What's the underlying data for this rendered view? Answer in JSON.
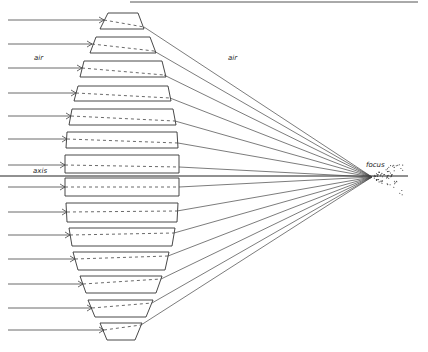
{
  "diagram": {
    "labels": {
      "air_left": "air",
      "air_right": "air",
      "axis": "axis",
      "focus": "focus"
    },
    "colors": {
      "stroke": "#333333",
      "ray": "#444444",
      "background": "#ffffff"
    },
    "focus_point": [
      372,
      177
    ],
    "axis_y": 176,
    "top_rule": [
      130,
      418,
      2
    ],
    "prisms": [
      {
        "top": [
          108,
          138,
          13
        ],
        "bot": [
          100,
          144,
          29
        ],
        "in": [
          104,
          20
        ],
        "out": [
          144,
          27
        ]
      },
      {
        "top": [
          96,
          150,
          37
        ],
        "bot": [
          90,
          156,
          53
        ],
        "in": [
          92,
          44
        ],
        "out": [
          154,
          51
        ]
      },
      {
        "top": [
          84,
          162,
          61
        ],
        "bot": [
          80,
          166,
          77
        ],
        "in": [
          82,
          68
        ],
        "out": [
          164,
          75
        ]
      },
      {
        "top": [
          78,
          168,
          86
        ],
        "bot": [
          74,
          171,
          101
        ],
        "in": [
          76,
          93
        ],
        "out": [
          170,
          98
        ]
      },
      {
        "top": [
          72,
          173,
          109
        ],
        "bot": [
          69,
          176,
          125
        ],
        "in": [
          71,
          116
        ],
        "out": [
          175,
          121
        ]
      },
      {
        "top": [
          67,
          177,
          132
        ],
        "bot": [
          66,
          178,
          148
        ],
        "in": [
          67,
          139
        ],
        "out": [
          178,
          143
        ]
      },
      {
        "top": [
          65,
          179,
          155
        ],
        "bot": [
          65,
          179,
          173
        ],
        "in": [
          65,
          165
        ],
        "out": [
          179,
          167
        ]
      },
      {
        "top": [
          65,
          179,
          178
        ],
        "bot": [
          65,
          179,
          196
        ],
        "in": [
          65,
          187
        ],
        "out": [
          179,
          187
        ]
      },
      {
        "top": [
          66,
          178,
          203
        ],
        "bot": [
          67,
          177,
          222
        ],
        "in": [
          67,
          212
        ],
        "out": [
          177,
          211
        ]
      },
      {
        "top": [
          69,
          175,
          228
        ],
        "bot": [
          72,
          172,
          246
        ],
        "in": [
          70,
          235
        ],
        "out": [
          174,
          233
        ]
      },
      {
        "top": [
          73,
          169,
          252
        ],
        "bot": [
          78,
          165,
          270
        ],
        "in": [
          75,
          259
        ],
        "out": [
          168,
          256
        ]
      },
      {
        "top": [
          80,
          162,
          276
        ],
        "bot": [
          86,
          156,
          293
        ],
        "in": [
          83,
          284
        ],
        "out": [
          161,
          279
        ]
      },
      {
        "top": [
          88,
          153,
          300
        ],
        "bot": [
          95,
          146,
          317
        ],
        "in": [
          92,
          308
        ],
        "out": [
          152,
          303
        ]
      },
      {
        "top": [
          100,
          142,
          323
        ],
        "bot": [
          107,
          135,
          340
        ],
        "in": [
          104,
          330
        ],
        "out": [
          141,
          325
        ]
      }
    ],
    "label_positions": {
      "air_left": [
        34,
        60
      ],
      "air_right": [
        228,
        60
      ],
      "axis": [
        33,
        173
      ],
      "focus": [
        366,
        167
      ]
    }
  }
}
